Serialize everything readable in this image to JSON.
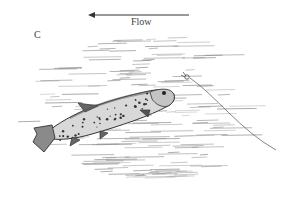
{
  "figure": {
    "panel_label": "C",
    "flow_label": "Flow",
    "flow_direction": "left",
    "colors": {
      "ink": "#333333",
      "water_lines": "#888888",
      "background": "#ffffff"
    }
  }
}
